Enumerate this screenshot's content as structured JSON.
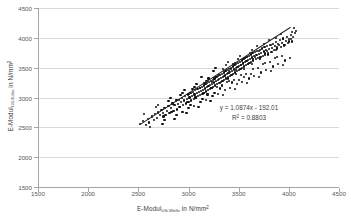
{
  "chart_data": {
    "type": "scatter",
    "title": "",
    "xlabel": "E-Modul US-Welle in N/mm²",
    "xlabel_main": "E-Modul",
    "xlabel_sub": "US-Welle",
    "xlabel_unit": "in N/mm",
    "xlabel_exp": "2",
    "ylabel": "E-Modul US-Echo in N/mm²",
    "ylabel_main": "E-Modul",
    "ylabel_sub": "US-Echo",
    "ylabel_unit": "in N/mm",
    "ylabel_exp": "2",
    "xlim": [
      1500,
      4500
    ],
    "ylim": [
      1500,
      4500
    ],
    "xticks": [
      1500,
      2000,
      2500,
      3000,
      3500,
      4000,
      4500
    ],
    "yticks": [
      1500,
      2000,
      2500,
      3000,
      3500,
      4000,
      4500
    ],
    "grid": "horizontal",
    "legend": "none",
    "annotations": {
      "equation": "y = 1.0874x - 192.01",
      "r_squared_label": "R",
      "r_squared_exp": "2",
      "r_squared_value": "= 0.8803",
      "r_squared_full": "R² = 0.8803"
    },
    "trendline": {
      "slope": 1.0874,
      "intercept": -192.01,
      "r2": 0.8803,
      "x_start": 2520,
      "x_end": 4015,
      "color": "#262626"
    },
    "marker": {
      "shape": "circle",
      "color": "#111111",
      "size": 2.2
    },
    "points": [
      [
        2520,
        2560
      ],
      [
        2545,
        2600
      ],
      [
        2575,
        2545
      ],
      [
        2600,
        2640
      ],
      [
        2610,
        2580
      ],
      [
        2640,
        2680
      ],
      [
        2655,
        2620
      ],
      [
        2670,
        2720
      ],
      [
        2690,
        2660
      ],
      [
        2700,
        2750
      ],
      [
        2715,
        2700
      ],
      [
        2730,
        2790
      ],
      [
        2745,
        2735
      ],
      [
        2760,
        2830
      ],
      [
        2770,
        2700
      ],
      [
        2785,
        2780
      ],
      [
        2800,
        2860
      ],
      [
        2810,
        2740
      ],
      [
        2825,
        2820
      ],
      [
        2840,
        2900
      ],
      [
        2850,
        2780
      ],
      [
        2860,
        2870
      ],
      [
        2875,
        2940
      ],
      [
        2885,
        2800
      ],
      [
        2895,
        2890
      ],
      [
        2905,
        2960
      ],
      [
        2915,
        2840
      ],
      [
        2925,
        2920
      ],
      [
        2935,
        2990
      ],
      [
        2945,
        2870
      ],
      [
        2955,
        2950
      ],
      [
        2965,
        3020
      ],
      [
        2975,
        2900
      ],
      [
        2985,
        2980
      ],
      [
        2995,
        3050
      ],
      [
        3000,
        2930
      ],
      [
        3010,
        3000
      ],
      [
        3020,
        3070
      ],
      [
        3028,
        2950
      ],
      [
        3036,
        3020
      ],
      [
        3044,
        3090
      ],
      [
        3052,
        2980
      ],
      [
        3060,
        3050
      ],
      [
        3068,
        3120
      ],
      [
        3075,
        3000
      ],
      [
        3082,
        3070
      ],
      [
        3090,
        3140
      ],
      [
        3097,
        3020
      ],
      [
        3104,
        3090
      ],
      [
        3111,
        3160
      ],
      [
        3118,
        3040
      ],
      [
        3125,
        3110
      ],
      [
        3132,
        3180
      ],
      [
        3139,
        3060
      ],
      [
        3146,
        3130
      ],
      [
        3152,
        3200
      ],
      [
        3158,
        3080
      ],
      [
        3164,
        3150
      ],
      [
        3170,
        3220
      ],
      [
        3176,
        3100
      ],
      [
        3182,
        3170
      ],
      [
        3188,
        3240
      ],
      [
        3194,
        3120
      ],
      [
        3200,
        3190
      ],
      [
        3206,
        3260
      ],
      [
        3212,
        3140
      ],
      [
        3218,
        3210
      ],
      [
        3224,
        3280
      ],
      [
        3230,
        3160
      ],
      [
        3236,
        3230
      ],
      [
        3242,
        3300
      ],
      [
        3248,
        3180
      ],
      [
        3254,
        3250
      ],
      [
        3260,
        3320
      ],
      [
        3266,
        3200
      ],
      [
        3272,
        3270
      ],
      [
        3278,
        3340
      ],
      [
        3284,
        3220
      ],
      [
        3290,
        3290
      ],
      [
        3296,
        3360
      ],
      [
        3302,
        3240
      ],
      [
        3308,
        3310
      ],
      [
        3314,
        3380
      ],
      [
        3320,
        3260
      ],
      [
        3326,
        3330
      ],
      [
        3332,
        3400
      ],
      [
        3338,
        3280
      ],
      [
        3344,
        3350
      ],
      [
        3350,
        3420
      ],
      [
        3356,
        3300
      ],
      [
        3362,
        3370
      ],
      [
        3368,
        3440
      ],
      [
        3374,
        3320
      ],
      [
        3380,
        3390
      ],
      [
        3386,
        3460
      ],
      [
        3392,
        3340
      ],
      [
        3398,
        3410
      ],
      [
        3404,
        3480
      ],
      [
        3410,
        3360
      ],
      [
        3416,
        3430
      ],
      [
        3422,
        3500
      ],
      [
        3428,
        3380
      ],
      [
        3434,
        3450
      ],
      [
        3440,
        3520
      ],
      [
        3446,
        3400
      ],
      [
        3452,
        3470
      ],
      [
        3458,
        3540
      ],
      [
        3464,
        3420
      ],
      [
        3470,
        3490
      ],
      [
        3476,
        3560
      ],
      [
        3482,
        3440
      ],
      [
        3488,
        3510
      ],
      [
        3494,
        3580
      ],
      [
        3500,
        3460
      ],
      [
        3506,
        3530
      ],
      [
        3512,
        3600
      ],
      [
        3518,
        3480
      ],
      [
        3524,
        3550
      ],
      [
        3530,
        3620
      ],
      [
        3536,
        3500
      ],
      [
        3542,
        3570
      ],
      [
        3548,
        3640
      ],
      [
        3554,
        3520
      ],
      [
        3560,
        3590
      ],
      [
        3566,
        3660
      ],
      [
        3572,
        3540
      ],
      [
        3578,
        3610
      ],
      [
        3584,
        3680
      ],
      [
        3590,
        3560
      ],
      [
        3596,
        3630
      ],
      [
        3602,
        3700
      ],
      [
        3608,
        3580
      ],
      [
        3614,
        3650
      ],
      [
        3620,
        3720
      ],
      [
        3626,
        3600
      ],
      [
        3632,
        3670
      ],
      [
        3638,
        3740
      ],
      [
        3646,
        3620
      ],
      [
        3654,
        3690
      ],
      [
        3662,
        3760
      ],
      [
        3670,
        3640
      ],
      [
        3678,
        3710
      ],
      [
        3686,
        3780
      ],
      [
        3694,
        3660
      ],
      [
        3702,
        3730
      ],
      [
        3710,
        3800
      ],
      [
        3718,
        3680
      ],
      [
        3726,
        3750
      ],
      [
        3734,
        3820
      ],
      [
        3742,
        3700
      ],
      [
        3750,
        3770
      ],
      [
        3758,
        3840
      ],
      [
        3766,
        3720
      ],
      [
        3774,
        3790
      ],
      [
        3782,
        3860
      ],
      [
        3790,
        3740
      ],
      [
        3800,
        3810
      ],
      [
        3810,
        3880
      ],
      [
        3820,
        3760
      ],
      [
        3830,
        3830
      ],
      [
        3840,
        3900
      ],
      [
        3850,
        3790
      ],
      [
        3860,
        3860
      ],
      [
        3872,
        3930
      ],
      [
        3884,
        3820
      ],
      [
        3896,
        3890
      ],
      [
        3908,
        3960
      ],
      [
        3920,
        3850
      ],
      [
        3932,
        3920
      ],
      [
        3944,
        3990
      ],
      [
        3956,
        3880
      ],
      [
        3968,
        3950
      ],
      [
        3980,
        4020
      ],
      [
        3992,
        3910
      ],
      [
        4005,
        3980
      ],
      [
        4018,
        4050
      ],
      [
        4030,
        3940
      ],
      [
        4045,
        4010
      ],
      [
        4060,
        4080
      ],
      [
        4075,
        4120
      ],
      [
        2560,
        2720
      ],
      [
        2620,
        2500
      ],
      [
        2700,
        2880
      ],
      [
        2760,
        2620
      ],
      [
        2820,
        2990
      ],
      [
        2880,
        2700
      ],
      [
        2940,
        3080
      ],
      [
        3000,
        2820
      ],
      [
        3060,
        3180
      ],
      [
        3120,
        2920
      ],
      [
        3180,
        3280
      ],
      [
        3240,
        3020
      ],
      [
        3300,
        3380
      ],
      [
        3360,
        3120
      ],
      [
        3420,
        3480
      ],
      [
        3480,
        3220
      ],
      [
        3540,
        3580
      ],
      [
        3600,
        3320
      ],
      [
        3660,
        3680
      ],
      [
        3720,
        3420
      ],
      [
        3780,
        3780
      ],
      [
        3840,
        3520
      ],
      [
        3900,
        3880
      ],
      [
        3960,
        3620
      ],
      [
        4020,
        3980
      ],
      [
        2680,
        2840
      ],
      [
        2740,
        2560
      ],
      [
        2800,
        2940
      ],
      [
        2860,
        2640
      ],
      [
        2920,
        3040
      ],
      [
        2980,
        2740
      ],
      [
        3040,
        3140
      ],
      [
        3100,
        2840
      ],
      [
        3160,
        3240
      ],
      [
        3220,
        2940
      ],
      [
        3280,
        3340
      ],
      [
        3340,
        3040
      ],
      [
        3400,
        3440
      ],
      [
        3460,
        3140
      ],
      [
        3520,
        3540
      ],
      [
        3580,
        3240
      ],
      [
        3640,
        3640
      ],
      [
        3700,
        3340
      ],
      [
        3760,
        3740
      ],
      [
        3820,
        3440
      ],
      [
        3880,
        3840
      ],
      [
        3940,
        3540
      ],
      [
        4000,
        3940
      ],
      [
        3250,
        3450
      ],
      [
        3310,
        3150
      ],
      [
        3370,
        3550
      ],
      [
        3430,
        3250
      ],
      [
        3490,
        3650
      ],
      [
        3550,
        3350
      ],
      [
        3610,
        3750
      ],
      [
        3130,
        3350
      ],
      [
        3190,
        3050
      ],
      [
        3270,
        3500
      ],
      [
        3330,
        3200
      ],
      [
        3390,
        3600
      ],
      [
        3450,
        3300
      ],
      [
        3510,
        3700
      ],
      [
        3570,
        3400
      ],
      [
        3630,
        3800
      ],
      [
        3690,
        3500
      ],
      [
        3750,
        3900
      ],
      [
        3810,
        3600
      ],
      [
        3870,
        4000
      ],
      [
        3930,
        3700
      ],
      [
        2960,
        3120
      ],
      [
        3020,
        2880
      ],
      [
        3080,
        3220
      ],
      [
        3140,
        2980
      ],
      [
        3200,
        3320
      ],
      [
        3260,
        3080
      ],
      [
        3380,
        3260
      ],
      [
        3440,
        3560
      ],
      [
        3500,
        3300
      ],
      [
        3560,
        3660
      ],
      [
        3620,
        3400
      ],
      [
        3680,
        3860
      ],
      [
        3740,
        3560
      ],
      [
        3800,
        3960
      ],
      [
        3860,
        3660
      ],
      [
        3920,
        4060
      ],
      [
        2880,
        2960
      ],
      [
        2940,
        2760
      ],
      [
        3000,
        3060
      ],
      [
        3055,
        2860
      ],
      [
        3115,
        3160
      ],
      [
        3175,
        2960
      ],
      [
        3235,
        3260
      ],
      [
        3295,
        3060
      ],
      [
        3355,
        3360
      ],
      [
        3415,
        3160
      ],
      [
        3475,
        3460
      ],
      [
        3535,
        3260
      ],
      [
        3595,
        3560
      ],
      [
        3655,
        3360
      ],
      [
        3715,
        3660
      ],
      [
        3775,
        3460
      ],
      [
        3835,
        3760
      ],
      [
        3895,
        3560
      ],
      [
        3955,
        3860
      ],
      [
        4015,
        3660
      ],
      [
        3285,
        3180
      ],
      [
        3345,
        3480
      ],
      [
        3405,
        3280
      ],
      [
        3465,
        3580
      ],
      [
        3525,
        3380
      ],
      [
        3585,
        3680
      ],
      [
        3645,
        3480
      ],
      [
        3705,
        3780
      ],
      [
        3765,
        3580
      ],
      [
        3825,
        3880
      ],
      [
        3885,
        3680
      ],
      [
        3945,
        3980
      ],
      [
        2750,
        2680
      ],
      [
        2830,
        2760
      ],
      [
        2910,
        2840
      ],
      [
        2990,
        2920
      ],
      [
        3070,
        3000
      ],
      [
        3150,
        3080
      ],
      [
        3230,
        3160
      ],
      [
        3310,
        3240
      ],
      [
        3390,
        3320
      ],
      [
        3470,
        3400
      ],
      [
        3550,
        3480
      ],
      [
        3630,
        3560
      ],
      [
        3710,
        3640
      ],
      [
        3790,
        3720
      ],
      [
        3870,
        3800
      ],
      [
        3950,
        3880
      ],
      [
        4030,
        4100
      ],
      [
        4055,
        4160
      ]
    ]
  }
}
